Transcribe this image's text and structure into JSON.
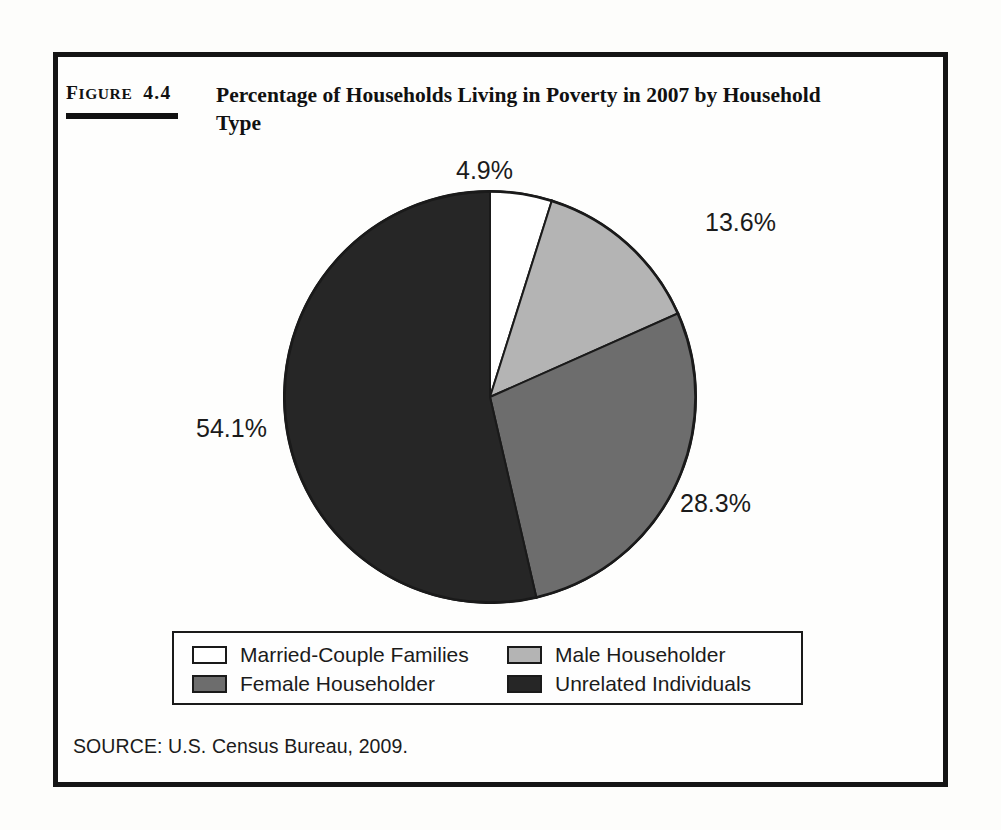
{
  "figure": {
    "label_prefix": "F",
    "label_caps": "IGURE",
    "label_number": "4.4",
    "title": "Percentage of Households Living in Poverty in 2007 by Household Type",
    "source": "SOURCE: U.S. Census Bureau, 2009."
  },
  "colors": {
    "married": "#ffffff",
    "male": "#b4b4b4",
    "female": "#6d6d6d",
    "unrelated": "#262626",
    "outline": "#1a1a1a",
    "frame": "#151515",
    "text": "#1b1b1b"
  },
  "legend": {
    "rows": [
      [
        {
          "key": "married",
          "label": "Married-Couple Families",
          "swatch": "#ffffff"
        },
        {
          "key": "male",
          "label": "Male Householder",
          "swatch": "#b4b4b4"
        }
      ],
      [
        {
          "key": "female",
          "label": "Female Householder",
          "swatch": "#6d6d6d"
        },
        {
          "key": "unrelated",
          "label": "Unrelated Individuals",
          "swatch": "#262626"
        }
      ]
    ]
  },
  "labels": {
    "married": "4.9%",
    "male": "13.6%",
    "female": "28.3%",
    "unrelated": "54.1%"
  },
  "chart_data": {
    "type": "pie",
    "title": "Percentage of Households Living in Poverty in 2007 by Household Type",
    "subtitle": "",
    "xlabel": "",
    "ylabel": "",
    "unit": "percent",
    "start_angle_deg": 0,
    "direction": "clockwise",
    "legend_position": "bottom",
    "grid": false,
    "categories": [
      "Married-Couple Families",
      "Male Householder",
      "Female Householder",
      "Unrelated Individuals"
    ],
    "values": [
      4.9,
      13.6,
      28.3,
      54.1
    ],
    "data_labels": [
      "4.9%",
      "13.6%",
      "28.3%",
      "54.1%"
    ],
    "slice_colors": [
      "#ffffff",
      "#b4b4b4",
      "#6d6d6d",
      "#262626"
    ],
    "total": 100.9,
    "source": "SOURCE: U.S. Census Bureau, 2009."
  }
}
